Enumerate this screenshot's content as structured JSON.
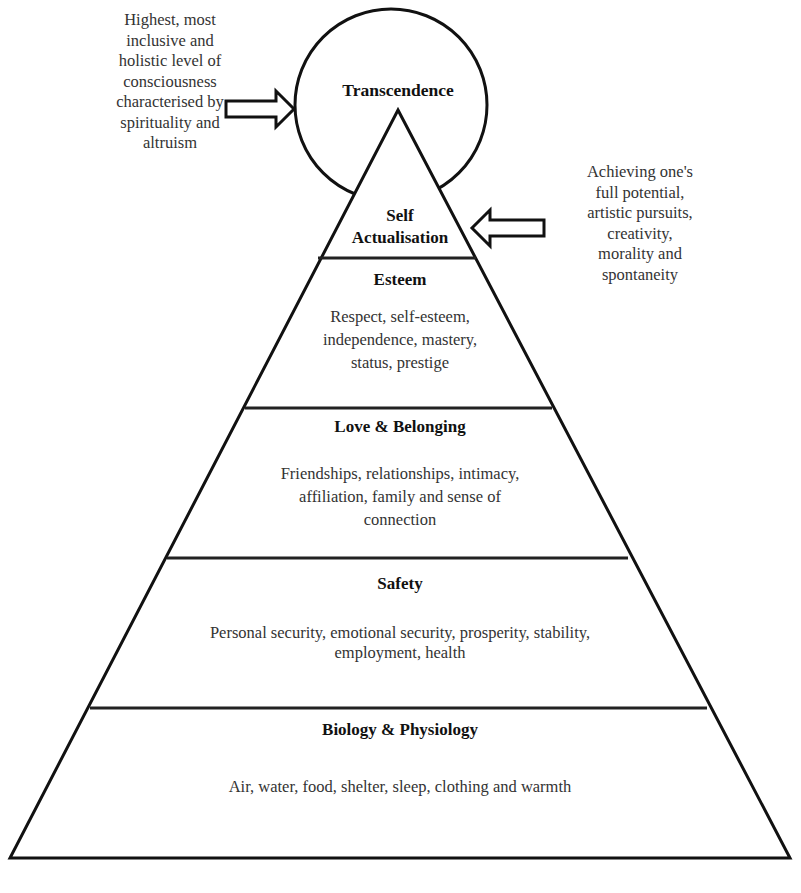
{
  "diagram": {
    "type": "hierarchy-pyramid",
    "top": {
      "title": "Transcendence",
      "note_lines": [
        "Highest, most",
        "inclusive and",
        "holistic level of",
        "consciousness",
        "characterised by",
        "spirituality and",
        "altruism"
      ]
    },
    "levels": [
      {
        "title_lines": [
          "Self",
          "Actualisation"
        ],
        "note_lines": [
          "Achieving one's",
          "full potential,",
          "artistic pursuits,",
          "creativity,",
          "morality and",
          "spontaneity"
        ]
      },
      {
        "title": "Esteem",
        "desc_lines": [
          "Respect, self-esteem,",
          "independence, mastery,",
          "status, prestige"
        ]
      },
      {
        "title": "Love & Belonging",
        "desc_lines": [
          "Friendships, relationships, intimacy,",
          "affiliation, family and sense of",
          "connection"
        ]
      },
      {
        "title": "Safety",
        "desc_lines": [
          "Personal security, emotional security, prosperity, stability,",
          "employment, health"
        ]
      },
      {
        "title": "Biology & Physiology",
        "desc_lines": [
          "Air, water, food, shelter, sleep, clothing and warmth"
        ]
      }
    ]
  }
}
